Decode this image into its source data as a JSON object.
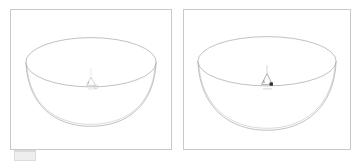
{
  "window": {
    "title": "Bowl Viewports",
    "background_color": "#ffffff"
  },
  "panels": [
    {
      "id": "left",
      "name": "left-viewport",
      "border_color": "#c9c9c9",
      "background_color": "#ffffff",
      "object_label": "bowl-wireframe",
      "line_color": "#8d8d8d",
      "marker": {
        "type": "axis-origin-triangle",
        "label": "A",
        "emphasis": "faint",
        "cursor": "circle",
        "color": "#b9b9b9"
      }
    },
    {
      "id": "right",
      "name": "right-viewport",
      "border_color": "#c9c9c9",
      "background_color": "#ffffff",
      "object_label": "bowl-wireframe",
      "line_color": "#8d8d8d",
      "marker": {
        "type": "axis-origin-triangle",
        "label": "A",
        "emphasis": "selected",
        "cursor": "square",
        "color": "#8f8f8f",
        "cursor_color": "#303030"
      }
    }
  ],
  "taskbar": {
    "tab_label": "",
    "color": "#eeeeee"
  }
}
